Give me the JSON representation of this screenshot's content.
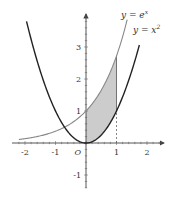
{
  "chart_data": {
    "type": "line",
    "title": "",
    "xlabel": "",
    "ylabel": "",
    "xlim": [
      -2.4,
      2.6
    ],
    "ylim": [
      -1.4,
      4.0
    ],
    "grid": false,
    "origin_label": "O",
    "x_ticks": [
      -2,
      -1,
      1,
      2
    ],
    "x_tick_labels": [
      "-2",
      "-1",
      "1",
      "2"
    ],
    "y_ticks": [
      -1,
      1,
      2,
      3
    ],
    "y_tick_labels": [
      "-1",
      "1",
      "2",
      "3"
    ],
    "series": [
      {
        "name": "y = e^x",
        "label_main": "y = e",
        "label_sup": "x",
        "function": "exp",
        "x_range": [
          -2.2,
          1.35
        ],
        "color": "#888888"
      },
      {
        "name": "y = x^2",
        "label_main": "y = x",
        "label_sup": "2",
        "function": "square",
        "x_range": [
          -1.95,
          1.75
        ],
        "color": "#222222"
      }
    ],
    "shaded_region": {
      "between": [
        "y = e^x",
        "y = x^2"
      ],
      "x_from": 0,
      "x_to": 1,
      "fill": "#cccccc"
    },
    "annotations": [
      {
        "type": "dashed-vertical",
        "x": 1,
        "y_from": 0,
        "y_to": 1
      }
    ]
  }
}
